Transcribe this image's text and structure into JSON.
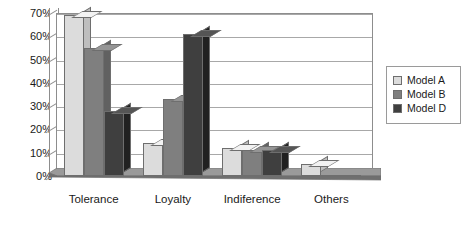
{
  "chart_data": {
    "type": "bar",
    "title": "",
    "subtitle": "",
    "xlabel": "",
    "ylabel": "",
    "categories": [
      "Tolerance",
      "Loyalty",
      "Indiference",
      "Others"
    ],
    "series": [
      {
        "name": "Model A",
        "color": "#dcdcdc",
        "values": [
          69,
          14,
          12,
          5
        ]
      },
      {
        "name": "Model B",
        "color": "#7f7f7f",
        "values": [
          55,
          33,
          11,
          0
        ]
      },
      {
        "name": "Model D",
        "color": "#3f3f3f",
        "values": [
          28,
          61,
          11,
          0
        ]
      }
    ],
    "ylim": [
      0,
      70
    ],
    "yticks": [
      0,
      10,
      20,
      30,
      40,
      50,
      60,
      70
    ],
    "ytick_labels": [
      "0%",
      "10%",
      "20%",
      "30%",
      "40%",
      "50%",
      "60%",
      "70%"
    ],
    "grid": true,
    "grid_axis": "y",
    "legend_position": "right",
    "style": "3d-column",
    "value_format": "percent"
  },
  "legend": {
    "entries": [
      {
        "label": "Model A",
        "color": "#dcdcdc"
      },
      {
        "label": "Model B",
        "color": "#7f7f7f"
      },
      {
        "label": "Model D",
        "color": "#3f3f3f"
      }
    ]
  },
  "colors": {
    "plot_border": "#8d8d8d",
    "gridline": "#a8a8a8",
    "bar_outline": "#6e6e6e",
    "floor_top": "#9a9a9a",
    "floor_front": "#7a7a7a",
    "background": "#ffffff",
    "text": "#1a1a1a"
  }
}
